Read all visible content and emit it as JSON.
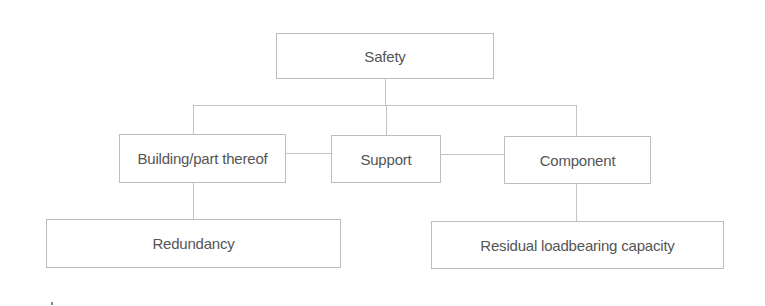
{
  "diagram": {
    "type": "hierarchy",
    "root": {
      "label": "Safety"
    },
    "level2": [
      {
        "label": "Building/part thereof"
      },
      {
        "label": "Support"
      },
      {
        "label": "Component"
      }
    ],
    "level3": [
      {
        "label": "Redundancy",
        "parent": "Building/part thereof"
      },
      {
        "label": "Residual loadbearing capacity",
        "parent": "Component"
      }
    ],
    "edges": [
      [
        "Safety",
        "Building/part thereof"
      ],
      [
        "Safety",
        "Support"
      ],
      [
        "Safety",
        "Component"
      ],
      [
        "Building/part thereof",
        "Support"
      ],
      [
        "Support",
        "Component"
      ],
      [
        "Building/part thereof",
        "Redundancy"
      ],
      [
        "Component",
        "Residual loadbearing capacity"
      ]
    ],
    "colors": {
      "border": "#bdbdbd",
      "line": "#c4c4c4",
      "text": "#555555",
      "background": "#ffffff"
    }
  }
}
